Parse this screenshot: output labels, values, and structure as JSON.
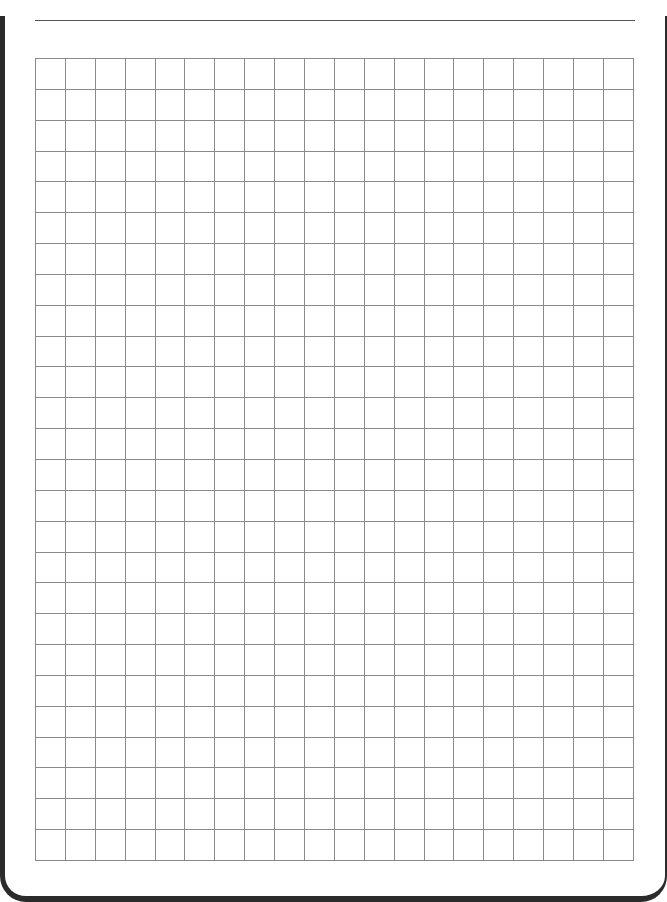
{
  "page": {
    "type": "graph-paper",
    "header_line": true,
    "grid": {
      "columns": 20,
      "rows": 26,
      "cell_width": 29.9,
      "cell_height": 30.85,
      "line_color": "#8a8a8a"
    },
    "frame_color": "#2b2b2b"
  }
}
